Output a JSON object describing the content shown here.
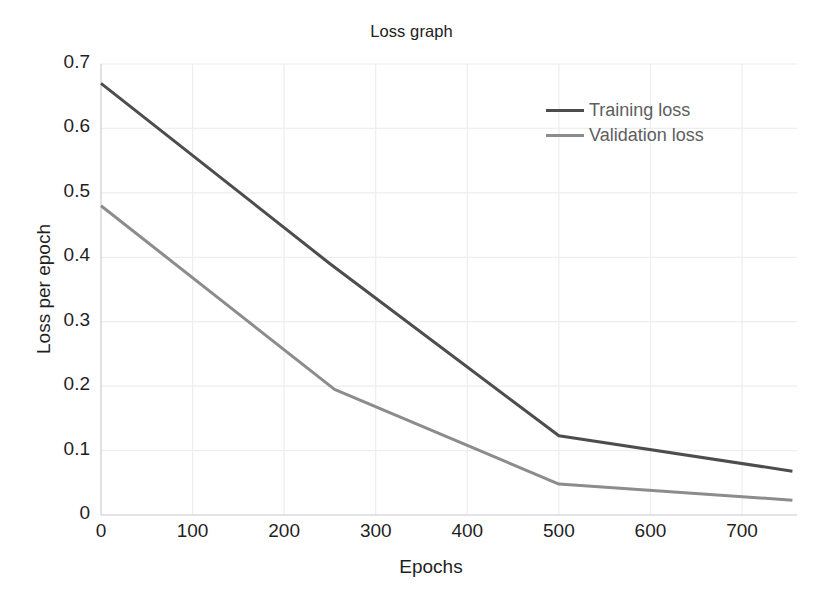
{
  "chart_data": {
    "type": "line",
    "title": "Loss graph",
    "xlabel": "Epochs",
    "ylabel": "Loss per epoch",
    "xlim": [
      0,
      760
    ],
    "ylim": [
      0,
      0.72
    ],
    "grid": true,
    "legend_position": "upper right",
    "xticks": [
      0,
      100,
      200,
      300,
      400,
      500,
      600,
      700
    ],
    "xtick_labels": [
      "0",
      "100",
      "200",
      "300",
      "400",
      "500",
      "600",
      "700"
    ],
    "yticks": [
      0,
      0.1,
      0.2,
      0.3,
      0.4,
      0.5,
      0.6,
      0.7
    ],
    "ytick_labels": [
      "0",
      "0.1",
      "0.2",
      "0.3",
      "0.4",
      "0.5",
      "0.6",
      "0.7"
    ],
    "series": [
      {
        "name": "Training loss",
        "color": "#4d4d4d",
        "width": 3.0,
        "x": [
          0,
          250,
          500,
          755
        ],
        "values": [
          0.67,
          0.39,
          0.123,
          0.068
        ]
      },
      {
        "name": "Validation loss",
        "color": "#8c8c8c",
        "width": 3.0,
        "x": [
          0,
          255,
          500,
          755
        ],
        "values": [
          0.48,
          0.195,
          0.048,
          0.023
        ]
      }
    ]
  },
  "figure": {
    "background": "#ffffff",
    "grid_color": "#ededf2",
    "axis_color": "#d9d9e0",
    "tick_text_color": "#1f1f1f",
    "legend_text_color": "#5e5e5e"
  }
}
